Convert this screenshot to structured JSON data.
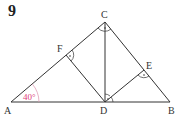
{
  "problem": {
    "number": "9"
  },
  "diagram": {
    "points": {
      "A": {
        "label": "A",
        "x": 11,
        "y": 102
      },
      "B": {
        "label": "B",
        "x": 170,
        "y": 102
      },
      "C": {
        "label": "C",
        "x": 105,
        "y": 22
      },
      "D": {
        "label": "D",
        "x": 105,
        "y": 102
      },
      "E": {
        "label": "E",
        "x": 144,
        "y": 70
      },
      "F": {
        "label": "F",
        "x": 66,
        "y": 55
      }
    },
    "angle_A": {
      "label": "40°",
      "color": "#e0407a"
    },
    "right_angles": [
      "C",
      "D",
      "E",
      "F"
    ],
    "line_color": "#333333"
  }
}
